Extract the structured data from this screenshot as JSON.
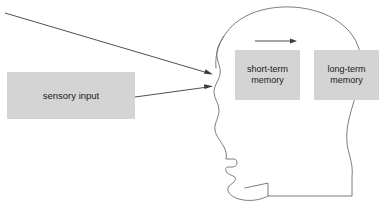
{
  "diagram": {
    "canvas": {
      "width": 381,
      "height": 209,
      "background": "#ffffff"
    },
    "colors": {
      "box_fill": "#d4d4d4",
      "box_text": "#1a1a1a",
      "outline_stroke": "#6e6e72",
      "arrow_stroke": "#3b3b3f"
    },
    "boxes": [
      {
        "id": "sensory-input",
        "label": "sensory input"
      },
      {
        "id": "short-term-memory",
        "label": "short-term\nmemory"
      },
      {
        "id": "long-term-memory",
        "label": "long-term\nmemory"
      }
    ],
    "arrows": [
      {
        "id": "stimulus-arrow",
        "label": ""
      },
      {
        "id": "sensory-input-arrow",
        "label": ""
      },
      {
        "id": "memory-transfer-arrow",
        "label": ""
      }
    ],
    "figure": {
      "id": "head-profile",
      "label": ""
    }
  }
}
